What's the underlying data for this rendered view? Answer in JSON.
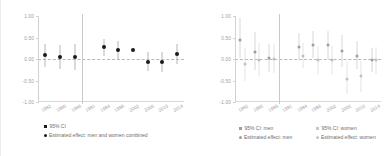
{
  "chart_data": [
    {
      "type": "scatter",
      "panel": "left",
      "title": "",
      "xlabel": "",
      "ylabel": "",
      "ylim": [
        -1.0,
        1.0
      ],
      "yticks": [
        1.0,
        0.5,
        0.0,
        -0.5,
        -1.0
      ],
      "ytick_labels": [
        "1.00",
        "0.50",
        "0.00",
        "-0.50",
        "-1.00"
      ],
      "grid": false,
      "zero_reference_line": true,
      "vertical_divider_after": "1988",
      "categories": [
        "1982",
        "1985",
        "1988",
        "1991",
        "1994",
        "1998",
        "2002",
        "2006",
        "2010",
        "2014"
      ],
      "legend_position": "bottom-left",
      "series": [
        {
          "name": "Estimated effect: men and women combined",
          "marker": "circle",
          "color": "#1a1a1a",
          "values": [
            0.09,
            0.04,
            0.05,
            null,
            0.28,
            0.2,
            0.22,
            -0.06,
            -0.06,
            0.11
          ],
          "ci_low": [
            -0.18,
            -0.24,
            -0.26,
            null,
            0.08,
            -0.02,
            0.22,
            -0.29,
            -0.3,
            -0.11
          ],
          "ci_high": [
            0.36,
            0.33,
            0.34,
            null,
            0.47,
            0.43,
            0.22,
            0.16,
            0.17,
            0.34
          ]
        }
      ],
      "legend": [
        {
          "label": "95% CI",
          "marker": "square",
          "color": "#1a1a1a"
        },
        {
          "label": "Estimated effect: men and women combined",
          "marker": "circle",
          "color": "#1a1a1a"
        }
      ]
    },
    {
      "type": "scatter",
      "panel": "right",
      "title": "",
      "xlabel": "",
      "ylabel": "",
      "ylim": [
        -1.0,
        1.0
      ],
      "yticks": [
        1.0,
        0.5,
        0.0,
        -0.5,
        -1.0
      ],
      "ytick_labels": [
        "1.00",
        "0.50",
        "0.00",
        "-0.50",
        "-1.00"
      ],
      "grid": false,
      "zero_reference_line": true,
      "vertical_divider_after": "1988",
      "categories": [
        "1982",
        "1985",
        "1988",
        "1991",
        "1994",
        "1998",
        "2002",
        "2006",
        "2010",
        "2014"
      ],
      "legend_position": "bottom",
      "series": [
        {
          "name": "Estimated effect: men",
          "marker": "circle",
          "color": "#9e9e9e",
          "values": [
            0.44,
            0.16,
            0.02,
            null,
            0.27,
            0.33,
            0.32,
            0.19,
            0.08,
            -0.02
          ],
          "ci_low": [
            0.02,
            -0.25,
            -0.3,
            null,
            -0.02,
            0.02,
            0.0,
            -0.18,
            -0.24,
            -0.3
          ],
          "ci_high": [
            0.95,
            0.62,
            0.36,
            null,
            0.6,
            0.66,
            0.65,
            0.56,
            0.42,
            0.26
          ]
        },
        {
          "name": "Estimated effect: women",
          "marker": "circle",
          "color": "#c0c0c0",
          "values": [
            -0.12,
            -0.02,
            0.01,
            null,
            0.08,
            -0.02,
            -0.03,
            -0.46,
            -0.4,
            -0.03
          ],
          "ci_low": [
            -0.52,
            -0.4,
            -0.32,
            null,
            -0.22,
            -0.34,
            -0.36,
            -0.82,
            -0.76,
            -0.34
          ],
          "ci_high": [
            0.26,
            0.38,
            0.34,
            null,
            0.38,
            0.3,
            0.3,
            -0.08,
            -0.05,
            0.28
          ]
        }
      ],
      "legend": [
        {
          "label": "95% CI: men",
          "marker": "square",
          "color": "#9e9e9e"
        },
        {
          "label": "95% CI: women",
          "marker": "square",
          "color": "#c6c6c6"
        },
        {
          "label": "Estimated effect: men",
          "marker": "circle",
          "color": "#9e9e9e"
        },
        {
          "label": "Estimated effect: women",
          "marker": "circle",
          "color": "#c6c6c6"
        }
      ]
    }
  ],
  "left_panel": {
    "yticks": [
      "1.00",
      "0.50",
      "0.00",
      "-0.50",
      "-1.00"
    ],
    "xticks": [
      "1982",
      "1985",
      "1988",
      "1991",
      "1994",
      "1998",
      "2002",
      "2006",
      "2010",
      "2014"
    ],
    "legend": {
      "ci_label": "95% CI",
      "effect_label": "Estimated effect: men and women combined"
    }
  },
  "right_panel": {
    "yticks": [
      "1.00",
      "0.50",
      "0.00",
      "-0.50",
      "-1.00"
    ],
    "xticks": [
      "1982",
      "1985",
      "1988",
      "1991",
      "1994",
      "1998",
      "2002",
      "2006",
      "2010",
      "2014"
    ],
    "legend": {
      "ci_men": "95% CI: men",
      "ci_women": "95% CI: women",
      "effect_men": "Estimated effect: men",
      "effect_women": "Estimated effect: women"
    }
  }
}
